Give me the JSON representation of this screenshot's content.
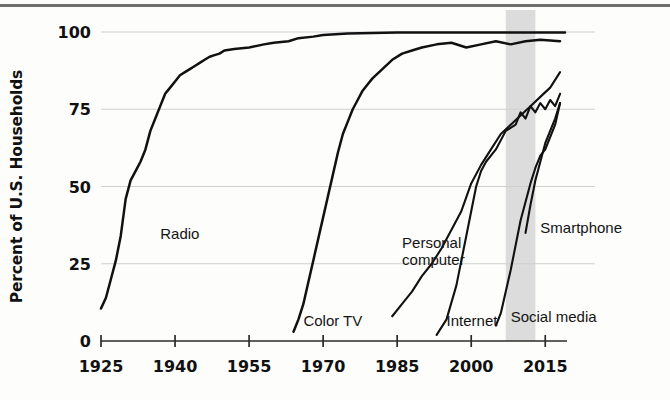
{
  "chart_data": {
    "type": "line",
    "title": "",
    "xlabel": "",
    "ylabel": "Percent of U.S. Households",
    "xlim": [
      1925,
      2019
    ],
    "ylim": [
      0,
      100
    ],
    "grid": true,
    "legend_position": "inline-annotations",
    "xticks": [
      1925,
      1940,
      1955,
      1970,
      1985,
      2000,
      2015
    ],
    "xtick_labels": [
      "1925",
      "1940",
      "1955",
      "1970",
      "1985",
      "2000",
      "2015"
    ],
    "yticks": [
      0,
      25,
      50,
      75,
      100
    ],
    "ytick_labels": [
      "0",
      "25",
      "50",
      "75",
      "100"
    ],
    "shaded_band": {
      "label": "",
      "x_start": 2007,
      "x_end": 2013,
      "color": "#d6d6d6"
    },
    "series": [
      {
        "name": "Radio",
        "label": "Radio",
        "label_x": 1937,
        "label_y": 33,
        "x": [
          1925,
          1926,
          1927,
          1928,
          1929,
          1930,
          1931,
          1932,
          1933,
          1934,
          1935,
          1936,
          1937,
          1938,
          1939,
          1940,
          1941,
          1942,
          1943,
          1944,
          1945,
          1946,
          1947,
          1948,
          1949,
          1950,
          1952,
          1955,
          1958,
          1960,
          1963,
          1965,
          1968,
          1970,
          1975,
          1980,
          1985,
          1990,
          1995,
          2000,
          2005,
          2010,
          2015,
          2019
        ],
        "y": [
          10.5,
          14,
          20,
          26,
          34,
          46,
          52,
          55,
          58,
          62,
          68,
          72,
          76,
          80,
          82,
          84,
          86,
          87,
          88,
          89,
          90,
          91,
          92,
          92.5,
          93,
          94,
          94.5,
          95,
          96,
          96.5,
          97,
          98,
          98.5,
          99,
          99.5,
          99.7,
          99.8,
          99.8,
          99.8,
          99.8,
          99.8,
          99.8,
          99.8,
          99.8
        ]
      },
      {
        "name": "Color TV",
        "label": "Color TV",
        "label_x": 1966,
        "label_y": 5,
        "x": [
          1964,
          1965,
          1966,
          1967,
          1968,
          1969,
          1970,
          1971,
          1972,
          1973,
          1974,
          1975,
          1976,
          1977,
          1978,
          1979,
          1980,
          1982,
          1984,
          1986,
          1988,
          1990,
          1993,
          1996,
          1999,
          2002,
          2005,
          2008,
          2011,
          2014,
          2018
        ],
        "y": [
          3,
          7,
          12,
          19,
          26,
          33,
          40,
          47,
          54,
          61,
          67,
          71,
          75,
          78,
          81,
          83,
          85,
          88,
          91,
          93,
          94,
          95,
          96,
          96.5,
          95,
          96,
          97,
          96,
          97,
          97.5,
          97
        ]
      },
      {
        "name": "Personal computer",
        "label": "Personal computer",
        "label_x": 1986,
        "label_y": 30,
        "label_line2": "",
        "x": [
          1984,
          1986,
          1988,
          1990,
          1992,
          1994,
          1996,
          1998,
          2000,
          2002,
          2004,
          2006,
          2008,
          2010,
          2012,
          2014,
          2016,
          2018
        ],
        "y": [
          8,
          12,
          16,
          21,
          25,
          30,
          36,
          42,
          51,
          57,
          62,
          67,
          70,
          73,
          76,
          79,
          82,
          87
        ]
      },
      {
        "name": "Internet",
        "label": "Internet",
        "label_x": 1995,
        "label_y": 5,
        "x": [
          1993,
          1995,
          1997,
          1998,
          1999,
          2000,
          2001,
          2002,
          2003,
          2005,
          2007,
          2009,
          2010,
          2011,
          2012,
          2013,
          2014,
          2015,
          2016,
          2017,
          2018
        ],
        "y": [
          2,
          7,
          18,
          26,
          34,
          42,
          50,
          55,
          58,
          62,
          68,
          70,
          74,
          72,
          76,
          74,
          77,
          75,
          78,
          76,
          80
        ]
      },
      {
        "name": "Social media",
        "label": "Social media",
        "label_x": 2008,
        "label_y": 6,
        "x": [
          2005,
          2006,
          2007,
          2008,
          2009,
          2010,
          2011,
          2012,
          2013,
          2014,
          2015,
          2016,
          2017,
          2018
        ],
        "y": [
          5,
          9,
          16,
          23,
          31,
          39,
          45,
          51,
          56,
          60,
          62,
          66,
          70,
          77
        ]
      },
      {
        "name": "Smartphone",
        "label": "Smartphone",
        "label_x": 2014,
        "label_y": 35,
        "x": [
          2011,
          2012,
          2013,
          2014,
          2015,
          2016,
          2017,
          2018
        ],
        "y": [
          35,
          44,
          52,
          58,
          64,
          68,
          72,
          77
        ]
      }
    ]
  }
}
